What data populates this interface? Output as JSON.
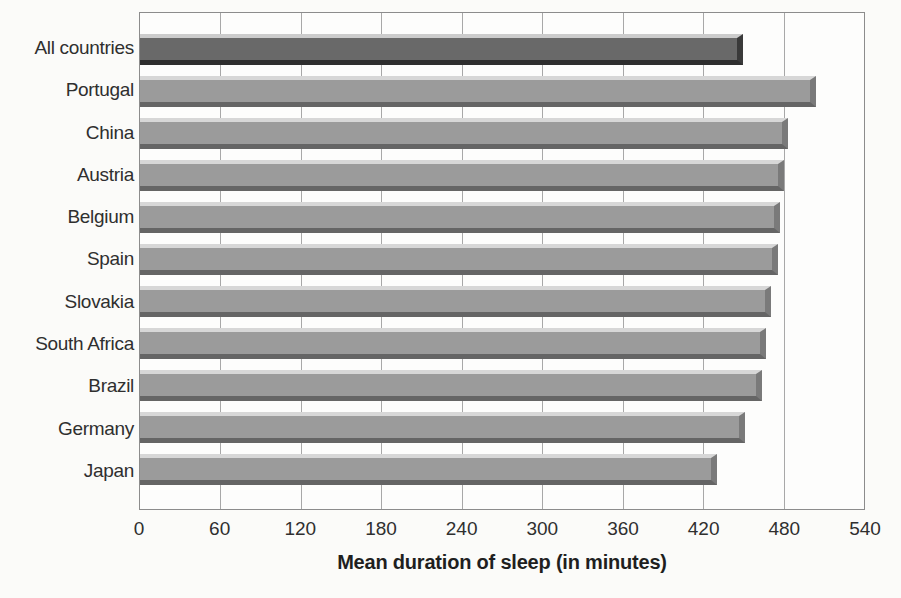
{
  "chart_data": {
    "type": "bar",
    "orientation": "horizontal",
    "xlabel": "Mean duration of sleep (in minutes)",
    "categories": [
      "All countries",
      "Portugal",
      "China",
      "Austria",
      "Belgium",
      "Spain",
      "Slovakia",
      "South Africa",
      "Brazil",
      "Germany",
      "Japan"
    ],
    "values": [
      450,
      504,
      483,
      480,
      477,
      476,
      471,
      467,
      464,
      451,
      430
    ],
    "xlim": [
      0,
      540
    ],
    "xticks": [
      0,
      60,
      120,
      180,
      240,
      300,
      360,
      420,
      480,
      540
    ],
    "grid": true,
    "legend_position": "none",
    "highlight_category": "All countries"
  },
  "colors": {
    "fig_bg": "#fbfbf9",
    "plot_bg": "#fdfdfc",
    "plot_border": "#8c8c8c",
    "gridline": "#a8a8a8",
    "text": "#2f2f2f",
    "title_text": "#1f1f1f",
    "bar_face": "#9b9b9b",
    "bar_bevel_top": "#d7d7d7",
    "bar_bevel_bottom": "#656565",
    "bar_bevel_right": "#7a7a7a",
    "highlight_face": "#696969",
    "highlight_bevel_top": "#cccccc",
    "highlight_bevel_bottom": "#2e2e2e",
    "highlight_bevel_right": "#3a3a3a"
  }
}
